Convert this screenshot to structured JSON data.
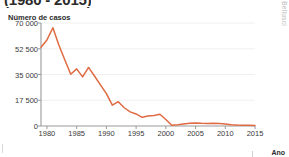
{
  "headline": "(1980 - 2015)",
  "credit": "E. Bellusci",
  "axes": {
    "y_title": "Número de casos",
    "x_title": "Ano",
    "y_ticks": [
      "0",
      "17 500",
      "35 000",
      "52 500",
      "70 000"
    ],
    "x_ticks": [
      "1980",
      "1985",
      "1990",
      "1995",
      "2000",
      "2005",
      "2010",
      "2015"
    ]
  },
  "colors": {
    "line": "#e06a42",
    "axis": "#9a9a9a",
    "grid": "#ececec",
    "text": "#3a3a3a",
    "credit": "#b9b9b9",
    "background": "#ffffff"
  },
  "chart_data": {
    "type": "line",
    "title": "(1980 - 2015)",
    "xlabel": "Ano",
    "ylabel": "Número de casos",
    "xlim": [
      1979,
      2015
    ],
    "ylim": [
      0,
      70000
    ],
    "yticks": [
      0,
      17500,
      35000,
      52500,
      70000
    ],
    "xticks": [
      1980,
      1985,
      1990,
      1995,
      2000,
      2005,
      2010,
      2015
    ],
    "grid": "horizontal",
    "legend": "none",
    "series": [
      {
        "name": "Número de casos",
        "color": "#e06a42",
        "x": [
          1979,
          1980,
          1981,
          1982,
          1983,
          1984,
          1985,
          1986,
          1987,
          1988,
          1989,
          1990,
          1991,
          1992,
          1993,
          1994,
          1995,
          1996,
          1997,
          1998,
          1999,
          2000,
          2001,
          2002,
          2003,
          2004,
          2005,
          2006,
          2007,
          2008,
          2009,
          2010,
          2011,
          2012,
          2013,
          2014,
          2015
        ],
        "values": [
          53500,
          58500,
          66800,
          55000,
          45000,
          35200,
          38800,
          33400,
          39800,
          34000,
          28000,
          22000,
          14200,
          16500,
          12400,
          9600,
          8200,
          5900,
          6800,
          7200,
          8000,
          4400,
          500,
          800,
          1400,
          1900,
          2000,
          1800,
          1700,
          1800,
          1700,
          1400,
          800,
          600,
          500,
          450,
          400
        ]
      }
    ]
  }
}
